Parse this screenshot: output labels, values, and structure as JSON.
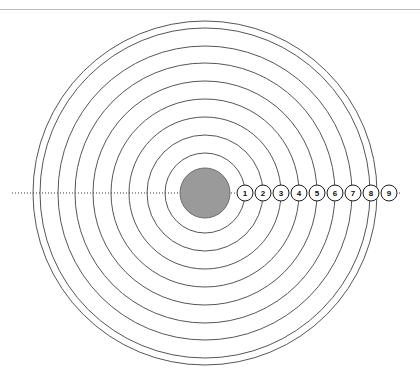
{
  "page": {
    "background_color": "#ffffff",
    "width": 420,
    "height": 378
  },
  "header": {
    "rule_color": "#b9bcc0",
    "rule_y": 9
  },
  "figure": {
    "name": "ring-target",
    "center_x": 205,
    "center_y": 193,
    "bullseye": {
      "label": "bullseye",
      "radius": 25,
      "fill_color": "#9a9a9a",
      "stroke_color": "#6c6c6c"
    },
    "ring_stroke_color": "#55565a",
    "ring_spacing": 17.9,
    "rings": [
      {
        "index": 1,
        "radius": 40
      },
      {
        "index": 2,
        "radius": 58
      },
      {
        "index": 3,
        "radius": 76
      },
      {
        "index": 4,
        "radius": 94
      },
      {
        "index": 5,
        "radius": 112
      },
      {
        "index": 6,
        "radius": 130
      },
      {
        "index": 7,
        "radius": 147
      },
      {
        "index": 8,
        "radius": 165
      },
      {
        "index": 9,
        "radius": 172
      }
    ],
    "axis": {
      "label": "horizontal-dotted-axis",
      "y": 193,
      "x_start": 12,
      "x_end": 402,
      "color": "#3a3a3a",
      "style": "dotted"
    },
    "markers": [
      {
        "label": "1",
        "x": 245,
        "y": 193,
        "radius": 8
      },
      {
        "label": "2",
        "x": 263,
        "y": 193,
        "radius": 8
      },
      {
        "label": "3",
        "x": 281,
        "y": 193,
        "radius": 8
      },
      {
        "label": "4",
        "x": 299,
        "y": 193,
        "radius": 8
      },
      {
        "label": "5",
        "x": 317,
        "y": 193,
        "radius": 8
      },
      {
        "label": "6",
        "x": 335,
        "y": 193,
        "radius": 8
      },
      {
        "label": "7",
        "x": 353,
        "y": 193,
        "radius": 8
      },
      {
        "label": "8",
        "x": 371,
        "y": 193,
        "radius": 8
      },
      {
        "label": "9",
        "x": 389,
        "y": 193,
        "radius": 8
      }
    ]
  },
  "chart_data": {
    "type": "scatter",
    "title": "",
    "xlabel": "",
    "ylabel": "",
    "grid": false,
    "legend": "none",
    "categories": [
      "1",
      "2",
      "3",
      "4",
      "5",
      "6",
      "7",
      "8",
      "9"
    ],
    "values": [
      40,
      58,
      76,
      94,
      112,
      130,
      147,
      165,
      172
    ],
    "series": [
      {
        "name": "ring radius (px)",
        "values": [
          40,
          58,
          76,
          94,
          112,
          130,
          147,
          165,
          172
        ]
      }
    ],
    "center": [
      205,
      193
    ],
    "bullseye_radius": 25,
    "xlim": [
      0,
      420
    ],
    "ylim": [
      0,
      378
    ]
  }
}
